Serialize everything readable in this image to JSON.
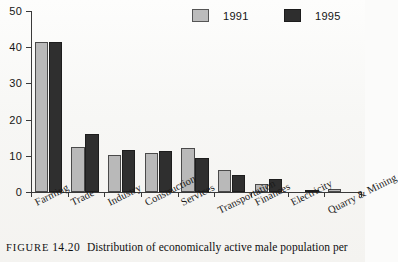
{
  "chart_data": {
    "type": "bar",
    "title": "",
    "xlabel": "",
    "ylabel": "",
    "ylim": [
      0,
      50
    ],
    "yticks": [
      0,
      10,
      20,
      30,
      40,
      50
    ],
    "grid": false,
    "legend_position": "top-right",
    "categories": [
      "Farming",
      "Trade",
      "Industry",
      "Construction",
      "Services",
      "Transportation",
      "Finances",
      "Electricity",
      "Quarry & Mining"
    ],
    "series": [
      {
        "name": "1991",
        "color": "#b9b9b9",
        "values": [
          41.5,
          12.4,
          10.3,
          10.7,
          12.2,
          6.2,
          2.1,
          0,
          0.8
        ]
      },
      {
        "name": "1995",
        "color": "#2f2f2f",
        "values": [
          41.5,
          16.0,
          11.7,
          11.2,
          9.5,
          4.7,
          3.5,
          0.6,
          0
        ]
      }
    ]
  },
  "legend": {
    "items": [
      {
        "label": "1991",
        "swatch": "s1991"
      },
      {
        "label": "1995",
        "swatch": "s1995"
      }
    ]
  },
  "caption": {
    "label": "FIGURE",
    "number": "14.20",
    "text": "Distribution of economically active male population per"
  }
}
